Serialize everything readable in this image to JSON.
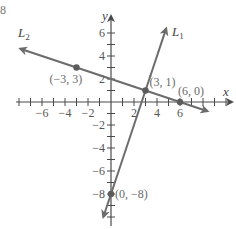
{
  "corner_fragment": "8",
  "chart_data": {
    "type": "line",
    "title": "",
    "xlabel": "x",
    "ylabel": "y",
    "xlim": [
      -8,
      10
    ],
    "ylim": [
      -10,
      7
    ],
    "grid": false,
    "legend": "none",
    "x_ticks": [
      -6,
      -4,
      -2,
      2,
      4,
      6
    ],
    "y_ticks": [
      6,
      4,
      2,
      -2,
      -4,
      -6,
      -8
    ],
    "series": [
      {
        "name": "L1",
        "label": "L1",
        "equation": "y = 3x - 8",
        "slope": 3,
        "intercept": -8,
        "points": [
          {
            "x": 0,
            "y": -8,
            "label": "(0, −8)"
          },
          {
            "x": 3,
            "y": 1,
            "label": "(3, 1)"
          }
        ]
      },
      {
        "name": "L2",
        "label": "L2",
        "equation": "y = -x/3 + 2",
        "slope": -0.3333,
        "intercept": 2,
        "points": [
          {
            "x": -3,
            "y": 3,
            "label": "(−3, 3)"
          },
          {
            "x": 3,
            "y": 1,
            "label": "(3, 1)"
          },
          {
            "x": 6,
            "y": 0,
            "label": "(6, 0)"
          }
        ]
      }
    ],
    "annotations": [
      {
        "text": "(−3, 3)",
        "x": -3,
        "y": 3
      },
      {
        "text": "(3, 1)",
        "x": 3,
        "y": 1
      },
      {
        "text": "(6, 0)",
        "x": 6,
        "y": 0
      },
      {
        "text": "(0, −8)",
        "x": 0,
        "y": -8
      }
    ],
    "line_labels": {
      "L1": {
        "main": "L",
        "sub": "1"
      },
      "L2": {
        "main": "L",
        "sub": "2"
      }
    }
  },
  "style": {
    "line_color": "#6b6b6b",
    "axis_color": "#4a4a4a",
    "point_color": "#5c5c5c"
  }
}
